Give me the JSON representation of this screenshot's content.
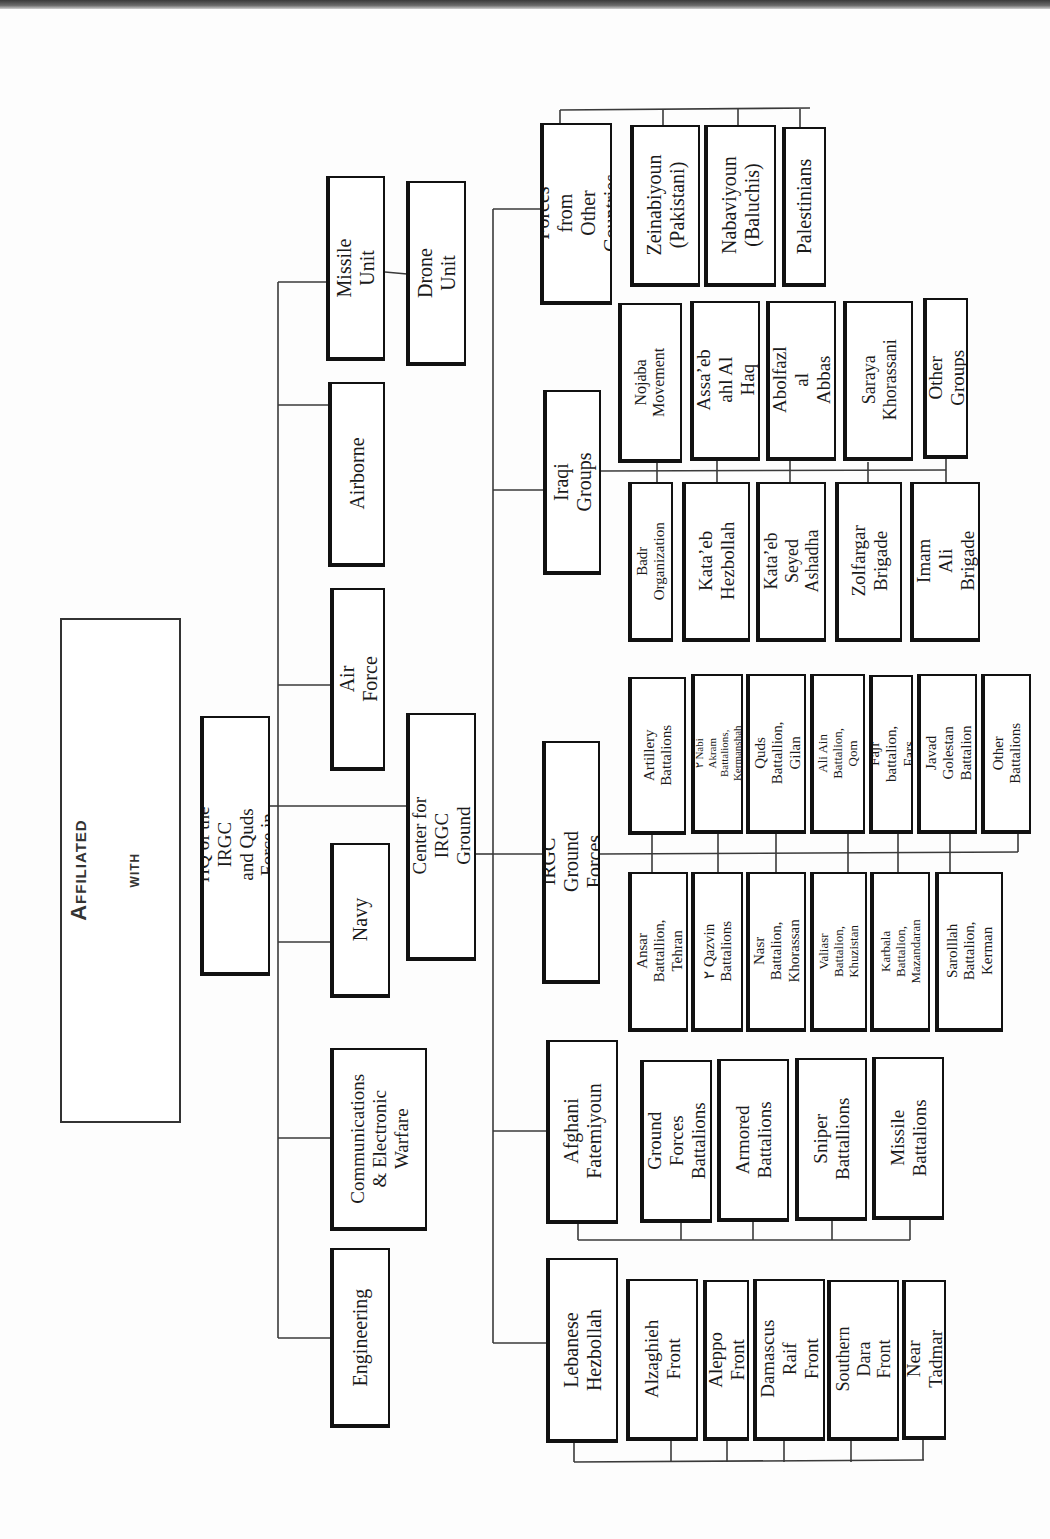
{
  "title": {
    "line1": "Military Forces Affiliated",
    "line2": "with",
    "line3": "The IRGC in Syria"
  },
  "headquarters": {
    "label": "Command HQ of the IRGC\nand Quds Force in Syria",
    "branches": [
      {
        "label": "Engineering"
      },
      {
        "label": "Communications\n& Electronic\nWarfare"
      },
      {
        "label": "Navy"
      },
      {
        "label": "Air Force"
      },
      {
        "label": "Airborne"
      },
      {
        "label": "Missile Unit",
        "children": [
          {
            "label": "Drone Unit"
          }
        ]
      }
    ]
  },
  "ground_command": {
    "label": "Command Center for\nIRGC Ground Forces",
    "groups": [
      {
        "label": "Lebanese\nHezbollah",
        "children": [
          {
            "label": "Alzaghieh\nFront"
          },
          {
            "label": "Aleppo Front"
          },
          {
            "label": "Damascus\nRaif Front"
          },
          {
            "label": "Southern Dara\nFront"
          },
          {
            "label": "Near Tadmar"
          }
        ]
      },
      {
        "label": "Afghani\nFatemiyoun",
        "children": [
          {
            "label": "Ground Forces\nBattalions"
          },
          {
            "label": "Armored\nBattalions"
          },
          {
            "label": "Sniper\nBattallions"
          },
          {
            "label": "Missile\nBattalions"
          }
        ]
      },
      {
        "label": "IRGC Ground Forces",
        "children_lower": [
          {
            "label": "Ansar Battallion,\nTehran"
          },
          {
            "label": "٢ Qazvin\nBattalions"
          },
          {
            "label": "Nasr Battalion,\nKhorassan"
          },
          {
            "label": "Valiasr Battalion,\nKhuzistan"
          },
          {
            "label": "Karbala Battalion,\nMazandaran"
          },
          {
            "label": "Sarolllah\nBattalion, Kerman"
          }
        ],
        "children_upper": [
          {
            "label": "Artillery\nBattalions"
          },
          {
            "label": "٢ Nabi Akram Battalions,\nKermanshah"
          },
          {
            "label": "Quds Battallion,\nGilan"
          },
          {
            "label": "Ali Ain Battalion,\nQom"
          },
          {
            "label": "Fajr battalion, Fars"
          },
          {
            "label": "Javad Golestan\nBattalion"
          },
          {
            "label": "Other Battalions"
          }
        ]
      },
      {
        "label": "Iraqi Groups",
        "children_lower": [
          {
            "label": "Badr Organization"
          },
          {
            "label": "Kata’eb\nHezbollah"
          },
          {
            "label": "Kata’eb Seyed\nAshadha"
          },
          {
            "label": "Zolfargar\nBrigade"
          },
          {
            "label": "Imam Ali\nBrigade"
          }
        ],
        "children_upper": [
          {
            "label": "Nojaba\nMovement"
          },
          {
            "label": "Assa’eb ahl Al\nHaq"
          },
          {
            "label": "Abolfazl al\nAbbas"
          },
          {
            "label": "Saraya\nKhorassani"
          },
          {
            "label": "Other Groups"
          }
        ]
      },
      {
        "label": "Forces from\nOther Countries",
        "children": [
          {
            "label": "Zeinabiyoun\n(Pakistani)"
          },
          {
            "label": "Nabaviyoun\n(Baluchis)"
          },
          {
            "label": "Palestinians"
          }
        ]
      }
    ]
  },
  "colors": {
    "line": "#333333",
    "box_border": "#111111",
    "background": "#fdfdfd"
  }
}
